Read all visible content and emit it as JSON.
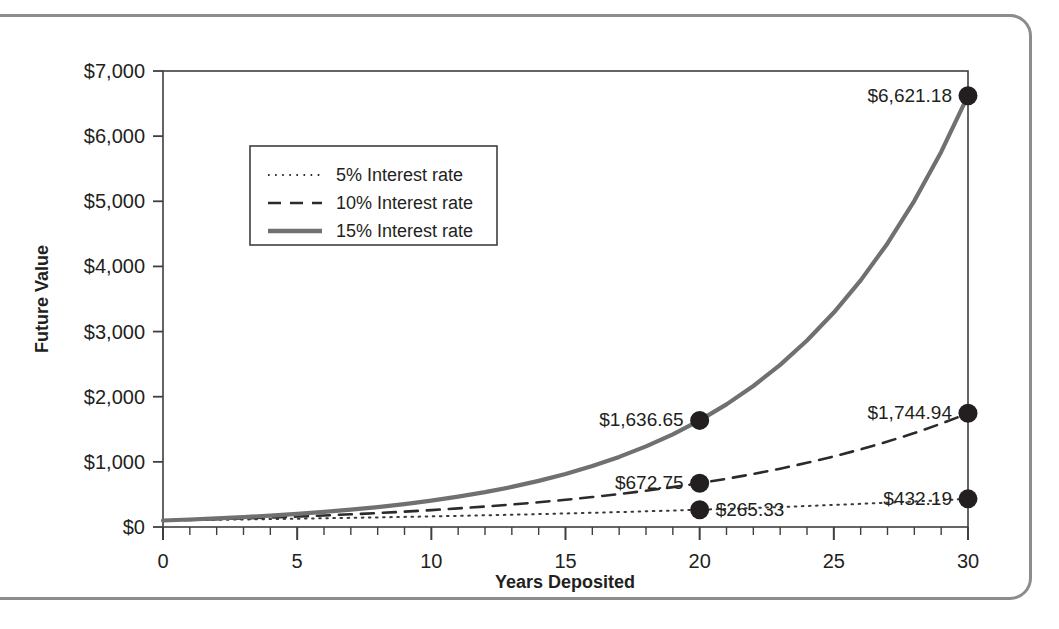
{
  "chart_data": {
    "type": "line",
    "title": "",
    "xlabel": "Years Deposited",
    "ylabel": "Future Value",
    "xlim": [
      0,
      30
    ],
    "ylim": [
      0,
      7000
    ],
    "grid": false,
    "legend_position": "upper-left-inside",
    "x_ticks": [
      "0",
      "5",
      "10",
      "15",
      "20",
      "25",
      "30"
    ],
    "x_tick_values": [
      0,
      5,
      10,
      15,
      20,
      25,
      30
    ],
    "x_minor_tick_step": 1,
    "y_ticks": [
      "$0",
      "$1,000",
      "$2,000",
      "$3,000",
      "$4,000",
      "$5,000",
      "$6,000",
      "$7,000"
    ],
    "y_tick_values": [
      0,
      1000,
      2000,
      3000,
      4000,
      5000,
      6000,
      7000
    ],
    "principal": 100,
    "series": [
      {
        "name": "5% Interest rate",
        "rate": 0.05,
        "style": "dotted",
        "color": "#3a3a3a",
        "width": 2,
        "values": [
          100,
          105,
          110.25,
          115.76,
          121.55,
          127.63,
          134.01,
          140.71,
          147.75,
          155.13,
          162.89,
          171.03,
          179.59,
          188.56,
          197.99,
          207.89,
          218.29,
          229.2,
          240.66,
          252.7,
          265.33,
          278.6,
          292.53,
          307.15,
          322.51,
          338.64,
          355.57,
          373.35,
          392.01,
          411.61,
          432.19
        ]
      },
      {
        "name": "10% Interest rate",
        "rate": 0.1,
        "style": "dashed",
        "color": "#2b2b2b",
        "width": 2.6,
        "values": [
          100,
          110,
          121,
          133.1,
          146.41,
          161.05,
          177.16,
          194.87,
          214.36,
          235.79,
          259.37,
          285.31,
          313.84,
          345.23,
          379.75,
          417.72,
          459.5,
          505.45,
          555.99,
          611.59,
          672.75,
          740.02,
          814.03,
          895.43,
          984.97,
          1083.47,
          1191.82,
          1311,
          1442.1,
          1586.31,
          1744.94
        ]
      },
      {
        "name": "15% Interest rate",
        "rate": 0.15,
        "style": "solid",
        "color": "#6e7072",
        "width": 4.2,
        "values": [
          100,
          115,
          132.25,
          152.09,
          174.9,
          201.14,
          231.31,
          266.0,
          305.9,
          351.79,
          404.56,
          465.24,
          535.03,
          615.28,
          707.57,
          813.71,
          935.76,
          1076.13,
          1237.55,
          1423.18,
          1636.65,
          1882.15,
          2164.47,
          2489.14,
          2862.52,
          3291.89,
          3785.68,
          4353.53,
          5006.56,
          5757.55,
          6621.18
        ]
      }
    ],
    "annotations": [
      {
        "label": "$6,621.18",
        "x": 30,
        "y": 6621.18,
        "series": "15% Interest rate",
        "anchor": "end"
      },
      {
        "label": "$1,636.65",
        "x": 20,
        "y": 1636.65,
        "series": "15% Interest rate",
        "anchor": "end"
      },
      {
        "label": "$1,744.94",
        "x": 30,
        "y": 1744.94,
        "series": "10% Interest rate",
        "anchor": "end"
      },
      {
        "label": "$672.75",
        "x": 20,
        "y": 672.75,
        "series": "10% Interest rate",
        "anchor": "end"
      },
      {
        "label": "$265.33",
        "x": 20,
        "y": 265.33,
        "series": "5% Interest rate",
        "anchor": "start"
      },
      {
        "label": "$432.19",
        "x": 30,
        "y": 432.19,
        "series": "5% Interest rate",
        "anchor": "end"
      }
    ],
    "legend_entries": [
      {
        "label": "5% Interest rate",
        "style": "dotted"
      },
      {
        "label": "10% Interest rate",
        "style": "dashed"
      },
      {
        "label": "15% Interest rate",
        "style": "solid"
      }
    ],
    "marker_color": "#231f20",
    "axis_color": "#3f3f3f",
    "frame_color": "#8a8c8e"
  }
}
